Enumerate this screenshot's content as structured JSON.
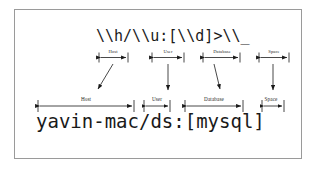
{
  "figure": {
    "background_color": "#ffffff",
    "border_color": "#9a9a9a",
    "ink_color": "#1a1a1a"
  },
  "pattern": {
    "text": "\\\\h/\\\\u:[\\\\d]>\\\\_",
    "description": "prompt escape string"
  },
  "prompt": {
    "text": "yavin-mac/ds:[mysql]",
    "description": "rendered prompt result"
  },
  "segments": [
    {
      "id": "host",
      "label_top": "Host",
      "label_bottom": "Host"
    },
    {
      "id": "user",
      "label_top": "User",
      "label_bottom": "User"
    },
    {
      "id": "database",
      "label_top": "Database",
      "label_bottom": "Database"
    },
    {
      "id": "space",
      "label_top": "Space",
      "label_bottom": "Space"
    }
  ]
}
